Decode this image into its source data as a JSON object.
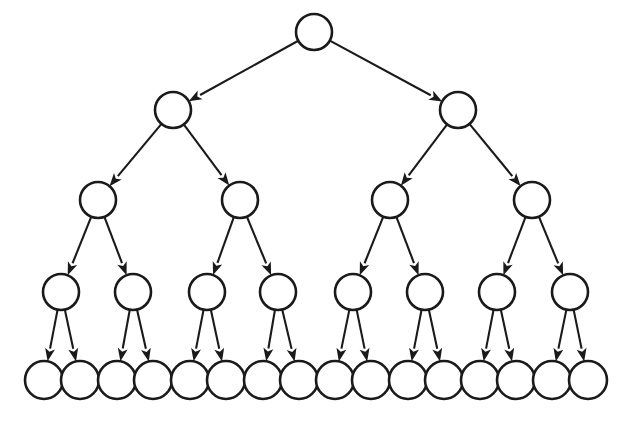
{
  "diagram": {
    "type": "directed-binary-tree",
    "depth": 5,
    "node_count": 31,
    "edge_count": 30,
    "background_color": "#ffffff",
    "node_fill_color": "#ffffff",
    "node_stroke_color": "#1a1a1a",
    "edge_color": "#1a1a1a",
    "node_label": "",
    "canvas": {
      "width": 636,
      "height": 428
    },
    "levels": [
      {
        "index": 0,
        "name": "root-level",
        "y": 32,
        "radius": 18,
        "count": 1,
        "nodes": [
          {
            "id": "n0",
            "label": "",
            "cx": 314,
            "cy": 32,
            "r": 18
          }
        ]
      },
      {
        "index": 1,
        "name": "level-2",
        "y": 110,
        "radius": 18,
        "count": 2,
        "nodes": [
          {
            "id": "n1",
            "label": "",
            "cx": 173,
            "cy": 110,
            "r": 18
          },
          {
            "id": "n2",
            "label": "",
            "cx": 458,
            "cy": 110,
            "r": 18
          }
        ]
      },
      {
        "index": 2,
        "name": "level-3",
        "y": 200,
        "radius": 18,
        "count": 4,
        "nodes": [
          {
            "id": "n3",
            "label": "",
            "cx": 98,
            "cy": 200,
            "r": 18
          },
          {
            "id": "n4",
            "label": "",
            "cx": 240,
            "cy": 200,
            "r": 18
          },
          {
            "id": "n5",
            "label": "",
            "cx": 390,
            "cy": 200,
            "r": 18
          },
          {
            "id": "n6",
            "label": "",
            "cx": 532,
            "cy": 200,
            "r": 18
          }
        ]
      },
      {
        "index": 3,
        "name": "level-4",
        "y": 292,
        "radius": 18,
        "count": 8,
        "nodes": [
          {
            "id": "n7",
            "label": "",
            "cx": 61,
            "cy": 292,
            "r": 18
          },
          {
            "id": "n8",
            "label": "",
            "cx": 133,
            "cy": 292,
            "r": 18
          },
          {
            "id": "n9",
            "label": "",
            "cx": 207,
            "cy": 292,
            "r": 18
          },
          {
            "id": "n10",
            "label": "",
            "cx": 278,
            "cy": 292,
            "r": 18
          },
          {
            "id": "n11",
            "label": "",
            "cx": 353,
            "cy": 292,
            "r": 18
          },
          {
            "id": "n12",
            "label": "",
            "cx": 425,
            "cy": 292,
            "r": 18
          },
          {
            "id": "n13",
            "label": "",
            "cx": 497,
            "cy": 292,
            "r": 18
          },
          {
            "id": "n14",
            "label": "",
            "cx": 570,
            "cy": 292,
            "r": 18
          }
        ]
      },
      {
        "index": 4,
        "name": "leaf-level",
        "y": 380,
        "radius": 19,
        "count": 16,
        "nodes": [
          {
            "id": "n15",
            "label": "",
            "cx": 44,
            "cy": 380,
            "r": 19
          },
          {
            "id": "n16",
            "label": "",
            "cx": 80,
            "cy": 380,
            "r": 19
          },
          {
            "id": "n17",
            "label": "",
            "cx": 117,
            "cy": 380,
            "r": 19
          },
          {
            "id": "n18",
            "label": "",
            "cx": 153,
            "cy": 380,
            "r": 19
          },
          {
            "id": "n19",
            "label": "",
            "cx": 190,
            "cy": 380,
            "r": 19
          },
          {
            "id": "n20",
            "label": "",
            "cx": 226,
            "cy": 380,
            "r": 19
          },
          {
            "id": "n21",
            "label": "",
            "cx": 263,
            "cy": 380,
            "r": 19
          },
          {
            "id": "n22",
            "label": "",
            "cx": 299,
            "cy": 380,
            "r": 19
          },
          {
            "id": "n23",
            "label": "",
            "cx": 335,
            "cy": 380,
            "r": 19
          },
          {
            "id": "n24",
            "label": "",
            "cx": 371,
            "cy": 380,
            "r": 19
          },
          {
            "id": "n25",
            "label": "",
            "cx": 408,
            "cy": 380,
            "r": 19
          },
          {
            "id": "n26",
            "label": "",
            "cx": 444,
            "cy": 380,
            "r": 19
          },
          {
            "id": "n27",
            "label": "",
            "cx": 480,
            "cy": 380,
            "r": 19
          },
          {
            "id": "n28",
            "label": "",
            "cx": 516,
            "cy": 380,
            "r": 19
          },
          {
            "id": "n29",
            "label": "",
            "cx": 552,
            "cy": 380,
            "r": 19
          },
          {
            "id": "n30",
            "label": "",
            "cx": 588,
            "cy": 380,
            "r": 19
          }
        ]
      }
    ],
    "edges": [
      {
        "id": "e0",
        "from": "n0",
        "to": "n1",
        "directed": true
      },
      {
        "id": "e1",
        "from": "n0",
        "to": "n2",
        "directed": true
      },
      {
        "id": "e2",
        "from": "n1",
        "to": "n3",
        "directed": true
      },
      {
        "id": "e3",
        "from": "n1",
        "to": "n4",
        "directed": true
      },
      {
        "id": "e4",
        "from": "n2",
        "to": "n5",
        "directed": true
      },
      {
        "id": "e5",
        "from": "n2",
        "to": "n6",
        "directed": true
      },
      {
        "id": "e6",
        "from": "n3",
        "to": "n7",
        "directed": true
      },
      {
        "id": "e7",
        "from": "n3",
        "to": "n8",
        "directed": true
      },
      {
        "id": "e8",
        "from": "n4",
        "to": "n9",
        "directed": true
      },
      {
        "id": "e9",
        "from": "n4",
        "to": "n10",
        "directed": true
      },
      {
        "id": "e10",
        "from": "n5",
        "to": "n11",
        "directed": true
      },
      {
        "id": "e11",
        "from": "n5",
        "to": "n12",
        "directed": true
      },
      {
        "id": "e12",
        "from": "n6",
        "to": "n13",
        "directed": true
      },
      {
        "id": "e13",
        "from": "n6",
        "to": "n14",
        "directed": true
      },
      {
        "id": "e14",
        "from": "n7",
        "to": "n15",
        "directed": true
      },
      {
        "id": "e15",
        "from": "n7",
        "to": "n16",
        "directed": true
      },
      {
        "id": "e16",
        "from": "n8",
        "to": "n17",
        "directed": true
      },
      {
        "id": "e17",
        "from": "n8",
        "to": "n18",
        "directed": true
      },
      {
        "id": "e18",
        "from": "n9",
        "to": "n19",
        "directed": true
      },
      {
        "id": "e19",
        "from": "n9",
        "to": "n20",
        "directed": true
      },
      {
        "id": "e20",
        "from": "n10",
        "to": "n21",
        "directed": true
      },
      {
        "id": "e21",
        "from": "n10",
        "to": "n22",
        "directed": true
      },
      {
        "id": "e22",
        "from": "n11",
        "to": "n23",
        "directed": true
      },
      {
        "id": "e23",
        "from": "n11",
        "to": "n24",
        "directed": true
      },
      {
        "id": "e24",
        "from": "n12",
        "to": "n25",
        "directed": true
      },
      {
        "id": "e25",
        "from": "n12",
        "to": "n26",
        "directed": true
      },
      {
        "id": "e26",
        "from": "n13",
        "to": "n27",
        "directed": true
      },
      {
        "id": "e27",
        "from": "n13",
        "to": "n28",
        "directed": true
      },
      {
        "id": "e28",
        "from": "n14",
        "to": "n29",
        "directed": true
      },
      {
        "id": "e29",
        "from": "n14",
        "to": "n30",
        "directed": true
      }
    ]
  }
}
